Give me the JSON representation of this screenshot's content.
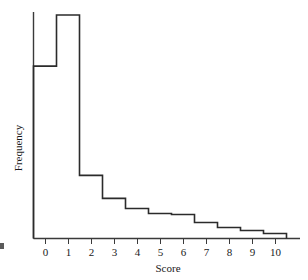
{
  "chart_data": {
    "type": "bar",
    "title": "",
    "subtitle": "",
    "xlabel": "Score",
    "ylabel": "Frequency",
    "categories": [
      "0",
      "1",
      "2",
      "3",
      "4",
      "5",
      "6",
      "7",
      "8",
      "9",
      "10"
    ],
    "values": [
      172,
      223,
      63,
      40,
      30,
      25,
      24,
      16,
      11,
      8,
      5
    ],
    "xlim": [
      -0.5,
      10.5
    ],
    "ylim": [
      0,
      240
    ],
    "grid": false,
    "legend": null,
    "legend_position": "none",
    "y_tick_labels": [],
    "x_tick_labels": [
      "0",
      "1",
      "2",
      "3",
      "4",
      "5",
      "6",
      "7",
      "8",
      "9",
      "10"
    ],
    "bar_width": 1,
    "style": "step-outline-histogram"
  },
  "axes": {
    "x_title": "Score",
    "y_title": "Frequency"
  },
  "colors": {
    "background": "#ffffff",
    "outline": "#2b2b2b",
    "axis": "#3a3a3a",
    "text": "#1a1a1a"
  }
}
